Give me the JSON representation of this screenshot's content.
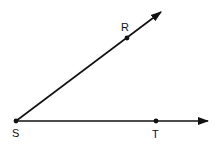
{
  "diagram": {
    "type": "angle",
    "stroke_color": "#111111",
    "background": "#ffffff",
    "points": [
      {
        "id": "S",
        "label": "S",
        "x": 16,
        "y": 121,
        "role": "vertex"
      },
      {
        "id": "R",
        "label": "R",
        "x": 127,
        "y": 38,
        "role": "point-on-ray"
      },
      {
        "id": "T",
        "label": "T",
        "x": 156,
        "y": 121,
        "role": "point-on-ray"
      }
    ],
    "rays": [
      {
        "id": "ray-SR",
        "from": "S",
        "through": "R",
        "end_x": 162,
        "end_y": 11
      },
      {
        "id": "ray-ST",
        "from": "S",
        "through": "T",
        "end_x": 209,
        "end_y": 121
      }
    ]
  }
}
